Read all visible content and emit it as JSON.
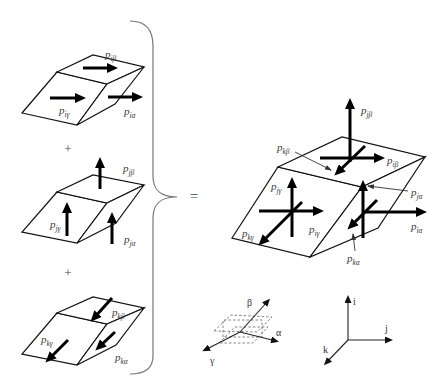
{
  "operators": {
    "plus_1": "+",
    "plus_2": "+",
    "equals": "="
  },
  "components": {
    "i": {
      "beta": {
        "base": "p",
        "sub": "iβ"
      },
      "gamma": {
        "base": "p",
        "sub": "iγ"
      },
      "alpha": {
        "base": "p",
        "sub": "iα"
      }
    },
    "j": {
      "beta": {
        "base": "p",
        "sub": "jβ"
      },
      "gamma": {
        "base": "p",
        "sub": "jγ"
      },
      "alpha": {
        "base": "p",
        "sub": "jα"
      }
    },
    "k": {
      "beta": {
        "base": "p",
        "sub": "kβ"
      },
      "gamma": {
        "base": "p",
        "sub": "kγ"
      },
      "alpha": {
        "base": "p",
        "sub": "kα"
      }
    }
  },
  "combined": {
    "j_beta": {
      "base": "p",
      "sub": "jβ"
    },
    "k_beta": {
      "base": "p",
      "sub": "kβ"
    },
    "i_beta": {
      "base": "p",
      "sub": "iβ"
    },
    "j_alpha": {
      "base": "p",
      "sub": "jα"
    },
    "i_alpha": {
      "base": "p",
      "sub": "iα"
    },
    "k_alpha": {
      "base": "p",
      "sub": "kα"
    },
    "j_gamma": {
      "base": "p",
      "sub": "jγ"
    },
    "i_gamma": {
      "base": "p",
      "sub": "iγ"
    },
    "k_gamma": {
      "base": "p",
      "sub": "kγ"
    }
  },
  "reference_frames": {
    "material": {
      "alpha": "α",
      "beta": "β",
      "gamma": "γ"
    },
    "global": {
      "i": "i",
      "j": "j",
      "k": "k"
    }
  }
}
